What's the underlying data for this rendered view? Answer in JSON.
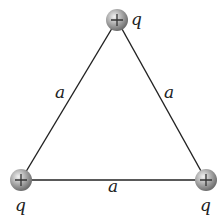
{
  "diagram": {
    "type": "equilateral triangle of point charges",
    "side_label": "a",
    "charges": [
      {
        "position": "top",
        "sign": "+",
        "label": "q",
        "x": 117,
        "y": 20
      },
      {
        "position": "bottom-left",
        "sign": "+",
        "label": "q",
        "x": 21,
        "y": 180
      },
      {
        "position": "bottom-right",
        "sign": "+",
        "label": "q",
        "x": 206,
        "y": 180
      }
    ],
    "sides": [
      {
        "name": "left",
        "label": "a"
      },
      {
        "name": "right",
        "label": "a"
      },
      {
        "name": "bottom",
        "label": "a"
      }
    ],
    "colors": {
      "line": "#222222",
      "charge": "#9a9a9a"
    }
  }
}
